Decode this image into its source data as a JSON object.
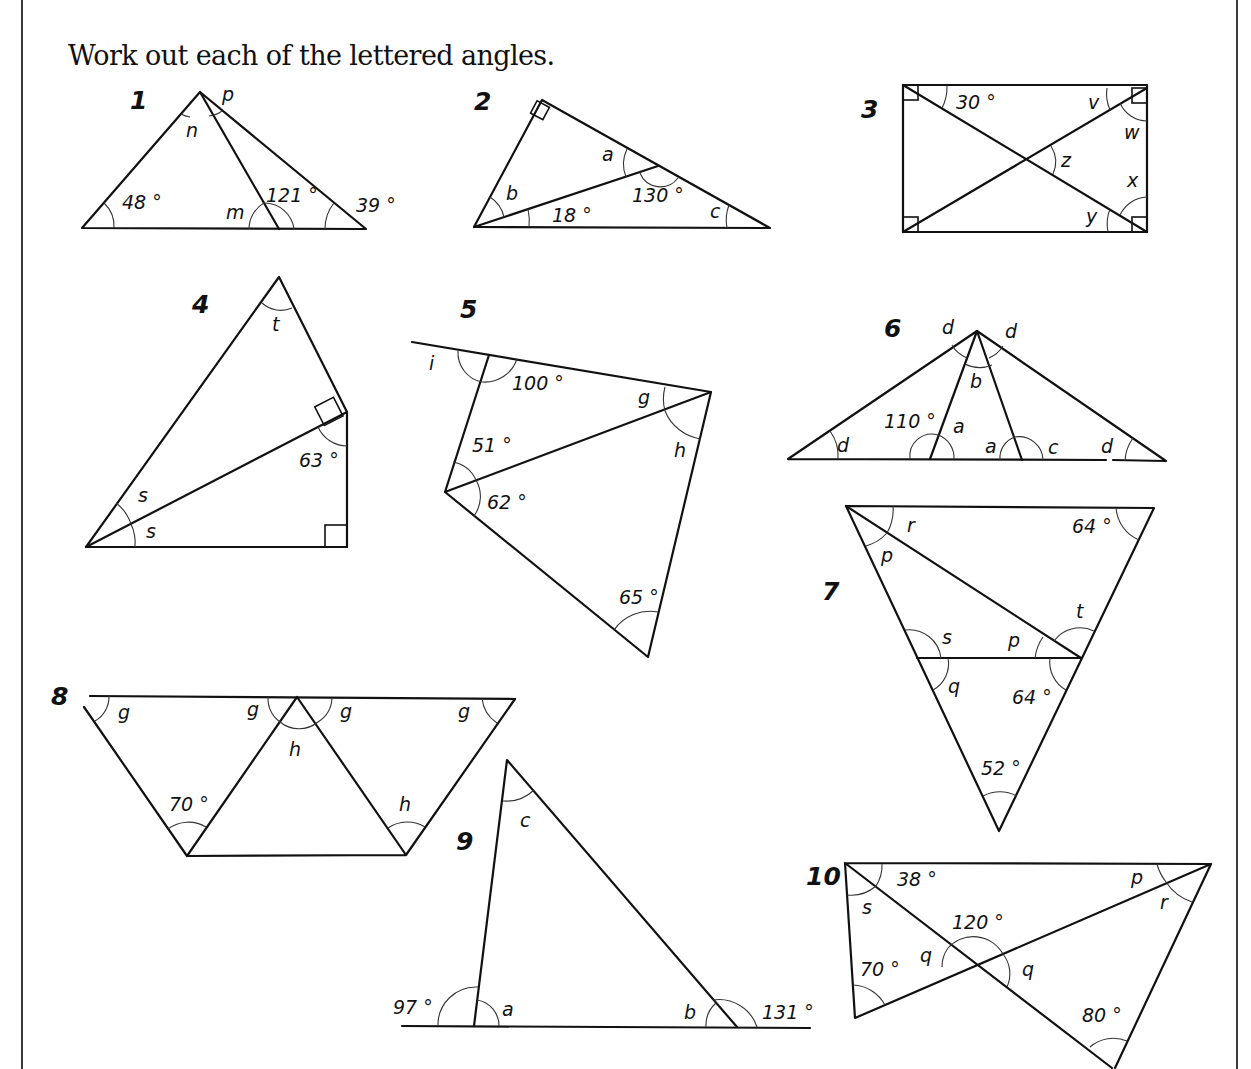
{
  "instruction": "Work out each of the lettered angles.",
  "problems": [
    {
      "number": "1",
      "labels": {
        "p": "p",
        "n": "n",
        "a48": "48 °",
        "m": "m",
        "a121": "121 °",
        "a39": "39 °"
      }
    },
    {
      "number": "2",
      "labels": {
        "a": "a",
        "b": "b",
        "a130": "130 °",
        "a18": "18 °",
        "c": "c"
      }
    },
    {
      "number": "3",
      "labels": {
        "a30": "30 °",
        "v": "v",
        "w": "w",
        "z": "z",
        "x": "x",
        "y": "y"
      }
    },
    {
      "number": "4",
      "labels": {
        "t": "t",
        "a63": "63 °",
        "s1": "s",
        "s2": "s"
      }
    },
    {
      "number": "5",
      "labels": {
        "i": "i",
        "a100": "100 °",
        "g": "g",
        "h": "h",
        "a51": "51 °",
        "a62": "62 °",
        "a65": "65 °"
      }
    },
    {
      "number": "6",
      "labels": {
        "d1": "d",
        "d2": "d",
        "b": "b",
        "a110": "110 °",
        "a1": "a",
        "a2": "a",
        "c": "c",
        "d3": "d",
        "d4": "d"
      }
    },
    {
      "number": "7",
      "labels": {
        "r": "r",
        "a64top": "64 °",
        "p1": "p",
        "t": "t",
        "s": "s",
        "p2": "p",
        "q": "q",
        "a64": "64 °",
        "a52": "52 °"
      }
    },
    {
      "number": "8",
      "labels": {
        "g1": "g",
        "g2": "g",
        "g3": "g",
        "g4": "g",
        "h1": "h",
        "a70": "70 °",
        "h2": "h"
      }
    },
    {
      "number": "9",
      "labels": {
        "c": "c",
        "a97": "97 °",
        "a": "a",
        "b": "b",
        "a131": "131 °"
      }
    },
    {
      "number": "10",
      "labels": {
        "a38": "38 °",
        "p": "p",
        "s": "s",
        "r": "r",
        "a120": "120 °",
        "q1": "q",
        "q2": "q",
        "a70": "70 °",
        "a80": "80 °"
      }
    }
  ]
}
